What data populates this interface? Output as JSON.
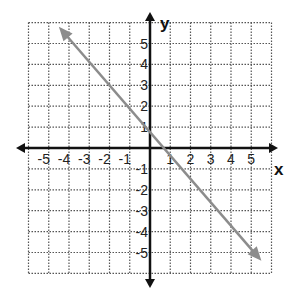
{
  "chart_data": {
    "type": "line",
    "title": "",
    "xlabel": "x",
    "ylabel": "y",
    "xlim": [
      -6,
      6
    ],
    "ylim": [
      -6,
      6
    ],
    "grid": true,
    "grid_style": "dotted",
    "x_ticks": [
      "-5",
      "-4",
      "-3",
      "-2",
      "-1",
      "1",
      "2",
      "3",
      "4",
      "5"
    ],
    "y_ticks": [
      "5",
      "4",
      "3",
      "2",
      "1",
      "-1",
      "-2",
      "-3",
      "-4",
      "-5"
    ],
    "series": [
      {
        "name": "line",
        "equation": "y = -x + 1",
        "slope": -1,
        "intercept": 1,
        "points": [
          [
            0,
            1
          ],
          [
            1,
            0
          ],
          [
            2,
            -1
          ]
        ],
        "start": [
          -4.5,
          5.8
        ],
        "end": [
          5.5,
          -5.4
        ],
        "arrows": "both",
        "color": "#8c8c8c"
      }
    ],
    "legend": null
  },
  "colors": {
    "axis": "#111111",
    "grid": "#555555",
    "line": "#8c8c8c"
  }
}
